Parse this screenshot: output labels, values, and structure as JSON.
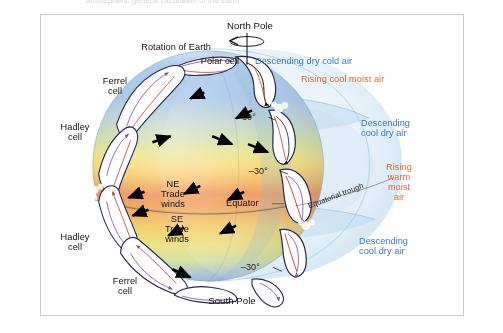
{
  "figure": {
    "title_cropped": "atmospheric general circulation of the earth",
    "background_color": "#ffffff",
    "border_color": "#c8c8c8"
  },
  "colors": {
    "label_black": "#111111",
    "label_blue": "#3a77bd",
    "label_orange": "#de6a33",
    "polar_blue": "#9fc2e8",
    "mid_green": "#bcd98a",
    "mid_yellow": "#f3df72",
    "equator_orange": "#ef8a4b",
    "atmosphere_blue": "#a8cfe8",
    "cell_fill": "#ffffff",
    "cell_outline": "#3b3f6e",
    "circulation_red": "#c0392b",
    "circulation_purple": "#8e5aa8",
    "wind_arrow": "#000000"
  },
  "labels": {
    "north_pole": "North Pole",
    "south_pole": "South Pole",
    "rotation_of_earth": "Rotation of Earth",
    "polar_cell": "Polar cell",
    "ferrel_cell_north": "Ferrel\ncell",
    "ferrel_cell_north_line1": "Ferrel",
    "ferrel_cell_north_line2": "cell",
    "hadley_cell_north_line1": "Hadley",
    "hadley_cell_north_line2": "cell",
    "hadley_cell_south_line1": "Hadley",
    "hadley_cell_south_line2": "cell",
    "ferrel_cell_south_line1": "Ferrel",
    "ferrel_cell_south_line2": "cell",
    "ne_trade_winds_line1": "NE",
    "ne_trade_winds_line2": "Trade",
    "ne_trade_winds_line3": "winds",
    "se_trade_winds_line1": "SE",
    "se_trade_winds_line2": "Trade",
    "se_trade_winds_line3": "winds",
    "equator": "Equator",
    "equatorial_trough": "Equatorial trough",
    "latitude_60_north": "–60°",
    "latitude_30_north": "–30°",
    "latitude_30_south": "–30°",
    "descending_dry_cold_air": "Descending dry cold air",
    "rising_cool_moist_air": "Rising cool moist air",
    "descending_cool_dry_air_upper_line1": "Descending",
    "descending_cool_dry_air_upper_line2": "cool dry air",
    "rising_warm_moist_air_line1": "Rising",
    "rising_warm_moist_air_line2": "warm",
    "rising_warm_moist_air_line3": "moist",
    "rising_warm_moist_air_line4": "air",
    "descending_cool_dry_air_lower_line1": "Descending",
    "descending_cool_dry_air_lower_line2": "cool dry air"
  },
  "diagram_data": {
    "type": "diagram",
    "subject": "Global atmospheric circulation cells on Earth",
    "circulation_cells": [
      {
        "name": "Polar cell",
        "hemisphere": "north",
        "latitude_range": "60° to 90°"
      },
      {
        "name": "Ferrel cell",
        "hemisphere": "north",
        "latitude_range": "30° to 60°"
      },
      {
        "name": "Hadley cell",
        "hemisphere": "north",
        "latitude_range": "0° to 30°"
      },
      {
        "name": "Hadley cell",
        "hemisphere": "south",
        "latitude_range": "0° to 30°"
      },
      {
        "name": "Ferrel cell",
        "hemisphere": "south",
        "latitude_range": "30° to 60°"
      },
      {
        "name": "Polar cell",
        "hemisphere": "south",
        "latitude_range": "60° to 90°"
      }
    ],
    "latitude_markers": [
      "–60°",
      "–30°",
      "Equator",
      "–30°"
    ],
    "wind_belts": [
      "NE Trade winds",
      "SE Trade winds"
    ],
    "air_motion_annotations": [
      {
        "text": "Descending dry cold air",
        "color": "#3a77bd",
        "location": "pole"
      },
      {
        "text": "Rising cool moist air",
        "color": "#de6a33",
        "location": "60° latitude"
      },
      {
        "text": "Descending cool dry air",
        "color": "#3a77bd",
        "location": "30° north latitude"
      },
      {
        "text": "Rising warm moist air",
        "color": "#de6a33",
        "location": "equator"
      },
      {
        "text": "Descending cool dry air",
        "color": "#3a77bd",
        "location": "30° south latitude"
      }
    ],
    "temperature_gradient": [
      {
        "zone": "poles",
        "color": "#9fc2e8"
      },
      {
        "zone": "mid-latitudes",
        "color": "#f3df72"
      },
      {
        "zone": "equator",
        "color": "#ef8a4b"
      }
    ]
  }
}
